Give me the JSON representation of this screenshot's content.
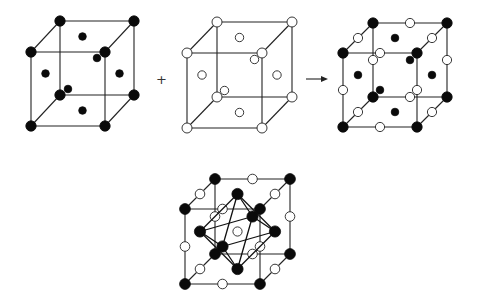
{
  "figure": {
    "operators": {
      "plus": "+",
      "arrow": "→"
    },
    "legend": {
      "filled_atom": "filled circle = atom type A",
      "open_atom": "open circle = atom type B"
    },
    "colors": {
      "filled": "#0a0a0a",
      "open_fill": "#ffffff",
      "edge": "#222222"
    },
    "panels": [
      {
        "id": "fcc-filled",
        "label": "FCC lattice of filled atoms (corners + face centers)"
      },
      {
        "id": "fcc-open",
        "label": "FCC lattice of open atoms (corners + face centers)"
      },
      {
        "id": "combined",
        "label": "Combined rock-salt structure (filled at corners/faces, open at edges)"
      },
      {
        "id": "octahedral",
        "label": "Octahedral coordination of filled atoms around central open site"
      }
    ]
  }
}
